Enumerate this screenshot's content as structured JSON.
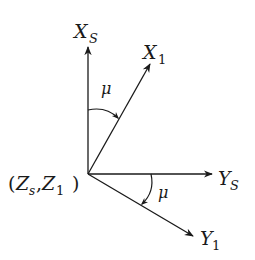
{
  "diagram": {
    "origin_label": {
      "open": "(",
      "z1": "Z",
      "z1_sub": "s",
      "sep": ",",
      "z2": "Z",
      "z2_sub": "1",
      "close": ")"
    },
    "axes": [
      {
        "id": "xs",
        "name": "X",
        "sub": "S"
      },
      {
        "id": "x1",
        "name": "X",
        "sub": "1"
      },
      {
        "id": "ys",
        "name": "Y",
        "sub": "S"
      },
      {
        "id": "y1",
        "name": "Y",
        "sub": "1"
      }
    ],
    "angles": [
      {
        "id": "upper",
        "symbol": "μ",
        "from": "X_S",
        "to": "X_1"
      },
      {
        "id": "lower",
        "symbol": "μ",
        "from": "Y_S",
        "to": "Y_1"
      }
    ],
    "colors": {
      "ink": "#1a1a1a",
      "background": "#ffffff"
    }
  }
}
